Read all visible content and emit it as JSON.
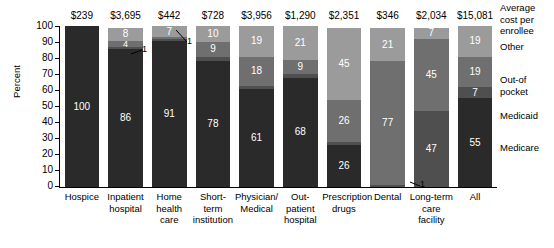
{
  "chart_data": {
    "type": "bar",
    "title": "",
    "xlabel": "",
    "ylabel": "Percent",
    "ylim": [
      0,
      100
    ],
    "ytick_labels": [
      "100",
      "90",
      "80",
      "70",
      "60",
      "50",
      "40",
      "30",
      "20",
      "10",
      "0"
    ],
    "stacked": true,
    "grid": false,
    "legend_position": "right",
    "legend_header": "Average cost per enrollee",
    "series": [
      {
        "name": "Medicare",
        "color": "#2a2a2a",
        "values": [
          100,
          86,
          91,
          78,
          61,
          68,
          26,
          0,
          0,
          55
        ]
      },
      {
        "name": "Medicaid",
        "color": "#4f4f4f",
        "values": [
          0,
          1,
          1,
          3,
          2,
          2,
          2,
          1,
          47,
          7
        ]
      },
      {
        "name": "Out-of pocket",
        "color": "#6f6f6f",
        "values": [
          0,
          4,
          1,
          9,
          18,
          9,
          26,
          77,
          45,
          19
        ]
      },
      {
        "name": "Other",
        "color": "#9b9b9b",
        "values": [
          0,
          8,
          7,
          10,
          19,
          21,
          45,
          21,
          7,
          19
        ]
      }
    ],
    "categories": [
      {
        "lines": [
          "Hospice"
        ],
        "cost": "$239"
      },
      {
        "lines": [
          "Inpatient",
          "hospital"
        ],
        "cost": "$3,695"
      },
      {
        "lines": [
          "Home",
          "health",
          "care"
        ],
        "cost": "$442"
      },
      {
        "lines": [
          "Short-",
          "term",
          "institution"
        ],
        "cost": "$728"
      },
      {
        "lines": [
          "Physician/",
          "Medical"
        ],
        "cost": "$3,956"
      },
      {
        "lines": [
          "Out-",
          "patient",
          "hospital"
        ],
        "cost": "$1,290"
      },
      {
        "lines": [
          "Prescription",
          "drugs"
        ],
        "cost": "$2,351"
      },
      {
        "lines": [
          "Dental"
        ],
        "cost": "$346"
      },
      {
        "lines": [
          "Long-term",
          "care",
          "facility"
        ],
        "cost": "$2,034"
      },
      {
        "lines": [
          "All"
        ],
        "cost": "$15,081"
      }
    ],
    "annotations": [
      {
        "id": "ann-inpatient-medicaid",
        "text": "1",
        "note": "leader line to 1% Medicaid sliver of Inpatient hospital bar"
      },
      {
        "id": "ann-homehealth-outofpocket",
        "text": "1",
        "note": "leader line to 1% Out-of-pocket sliver of Home health care bar"
      },
      {
        "id": "ann-dental-medicaid",
        "text": "1",
        "note": "leader line to 1% Medicaid sliver at base of Dental bar"
      }
    ]
  },
  "legend": {
    "header_lines": [
      "Average",
      "cost per",
      "enrollee"
    ],
    "items": [
      {
        "label_lines": [
          "Other"
        ]
      },
      {
        "label_lines": [
          "Out-of",
          "pocket"
        ]
      },
      {
        "label_lines": [
          "Medicaid"
        ]
      },
      {
        "label_lines": [
          "Medicare"
        ]
      }
    ]
  }
}
